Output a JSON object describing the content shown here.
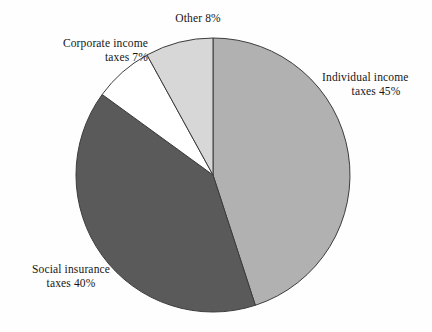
{
  "chart_data": {
    "type": "pie",
    "title": "",
    "subtitle": "",
    "xlabel": "",
    "ylabel": "",
    "legend_position": "none",
    "grid": false,
    "labels_outside": true,
    "start_angle_deg": 0,
    "direction": "clockwise",
    "center": {
      "x": 213,
      "y": 175
    },
    "radius": 137,
    "categories": [
      "Individual income taxes",
      "Social insurance taxes",
      "Corporate income taxes",
      "Other"
    ],
    "values": [
      45,
      40,
      7,
      8
    ],
    "value_unit": "percent",
    "colors": [
      "#b1b1b1",
      "#5a5a5a",
      "#ffffff",
      "#d7d7d7"
    ],
    "stroke_color": "#3c3c3c",
    "slices": [
      {
        "name": "Individual income taxes",
        "value": 45,
        "value_text": "45%",
        "color": "#b1b1b1",
        "label_lines": [
          "Individual income",
          "taxes 45%"
        ]
      },
      {
        "name": "Social insurance taxes",
        "value": 40,
        "value_text": "40%",
        "color": "#5a5a5a",
        "label_lines": [
          "Social insurance",
          "taxes 40%"
        ]
      },
      {
        "name": "Corporate income taxes",
        "value": 7,
        "value_text": "7%",
        "color": "#ffffff",
        "label_lines": [
          "Corporate income",
          "taxes 7%"
        ]
      },
      {
        "name": "Other",
        "value": 8,
        "value_text": "8%",
        "color": "#d7d7d7",
        "label_lines": [
          "Other 8%"
        ]
      }
    ]
  },
  "labels": {
    "other": {
      "line1": "Other 8%"
    },
    "corporate": {
      "line1": "Corporate income",
      "line2": "taxes 7%"
    },
    "individual": {
      "line1": "Individual income",
      "line2": "taxes 45%"
    },
    "social": {
      "line1": "Social insurance",
      "line2": "taxes 40%"
    }
  }
}
